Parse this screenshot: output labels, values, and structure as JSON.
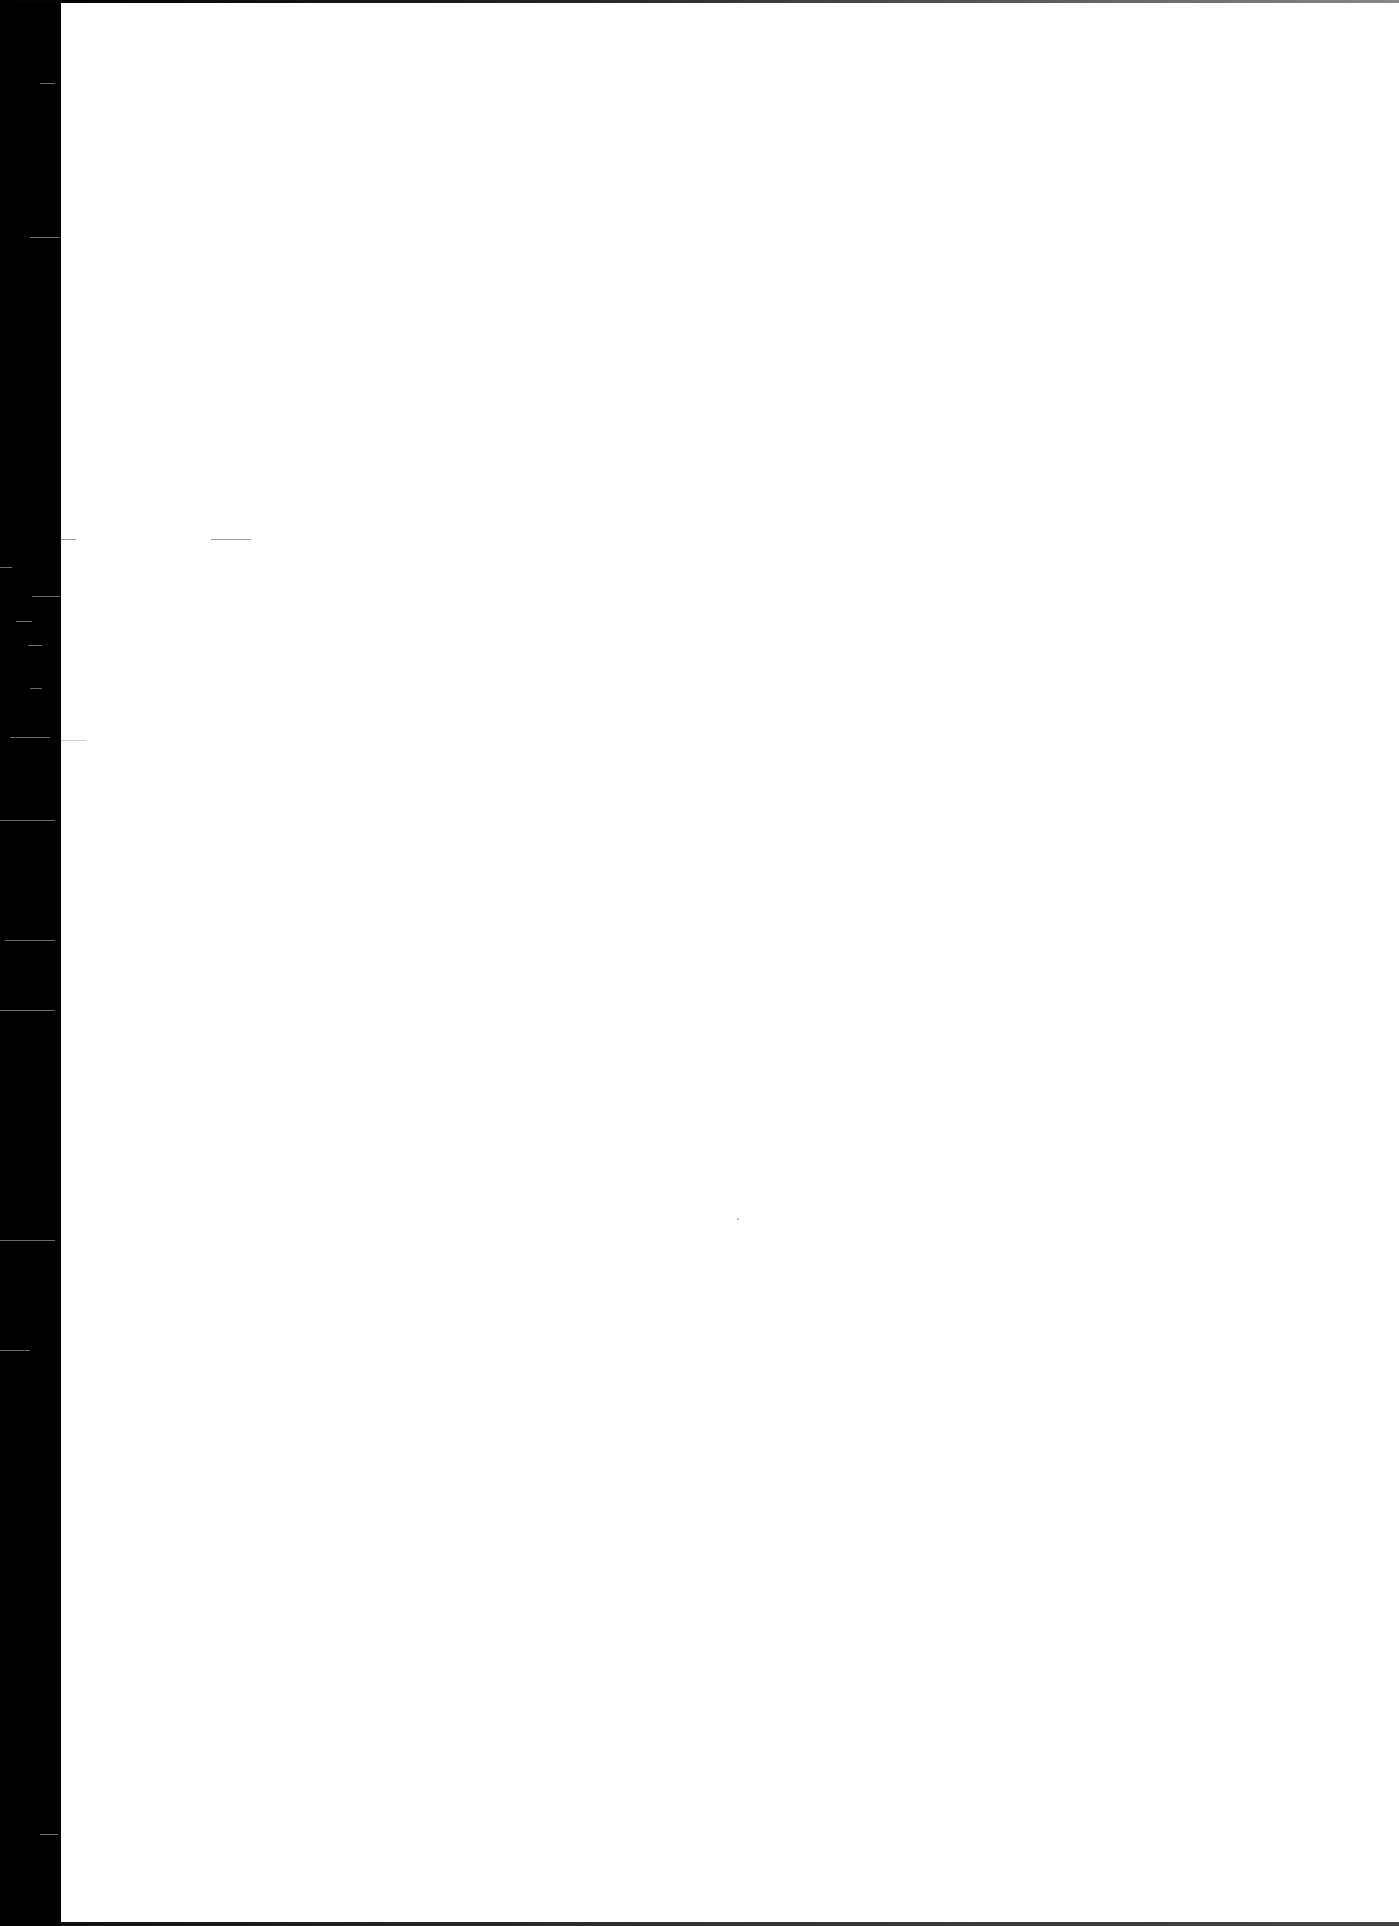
{
  "document": {
    "type": "blank scanned page",
    "text": ""
  },
  "colors": {
    "page": "#ffffff",
    "scan_edge": "#000000"
  }
}
